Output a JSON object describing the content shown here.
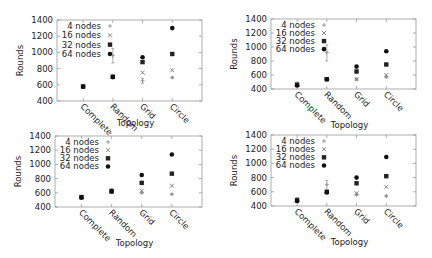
{
  "chart_data": [
    {
      "type": "scatter",
      "title": "",
      "xlabel": "Topology",
      "ylabel": "Rounds",
      "ylim": [
        400,
        1400
      ],
      "yticks": [
        400,
        600,
        800,
        1000,
        1200,
        1400
      ],
      "categories": [
        "Complete",
        "Random",
        "Grid",
        "Circle"
      ],
      "legend_position": "top-left (inside)",
      "grid": false,
      "series": [
        {
          "name": "4 nodes",
          "marker": "plus",
          "values": [
            580,
            960,
            650,
            690
          ],
          "error": [
            [
              570,
              590
            ],
            [
              870,
              1050
            ],
            [
              620,
              680
            ],
            [
              680,
              700
            ]
          ]
        },
        {
          "name": "16 nodes",
          "marker": "x",
          "values": [
            580,
            700,
            750,
            780
          ]
        },
        {
          "name": "32 nodes",
          "marker": "square",
          "values": [
            580,
            700,
            880,
            980
          ]
        },
        {
          "name": "64 nodes",
          "marker": "circle",
          "values": [
            575,
            695,
            940,
            1300
          ]
        }
      ]
    },
    {
      "type": "scatter",
      "title": "",
      "xlabel": "Topology",
      "ylabel": "Rounds",
      "ylim": [
        400,
        1400
      ],
      "yticks": [
        400,
        600,
        800,
        1000,
        1200,
        1400
      ],
      "categories": [
        "Complete",
        "Random",
        "Grid",
        "Circle"
      ],
      "legend_position": "top-left (inside)",
      "grid": false,
      "series": [
        {
          "name": "4 nodes",
          "marker": "plus",
          "values": [
            470,
            920,
            540,
            570
          ],
          "error": [
            [
              450,
              500
            ],
            [
              800,
              1030
            ],
            [
              530,
              550
            ],
            [
              560,
              580
            ]
          ]
        },
        {
          "name": "16 nodes",
          "marker": "x",
          "values": [
            470,
            540,
            540,
            600
          ]
        },
        {
          "name": "32 nodes",
          "marker": "square",
          "values": [
            460,
            540,
            650,
            750
          ]
        },
        {
          "name": "64 nodes",
          "marker": "circle",
          "values": [
            450,
            540,
            720,
            940
          ]
        }
      ]
    },
    {
      "type": "scatter",
      "title": "",
      "xlabel": "Topology",
      "ylabel": "Rounds",
      "ylim": [
        400,
        1400
      ],
      "yticks": [
        400,
        600,
        800,
        1000,
        1200,
        1400
      ],
      "categories": [
        "Complete",
        "Random",
        "Grid",
        "Circle"
      ],
      "legend_position": "top-left (inside)",
      "grid": false,
      "series": [
        {
          "name": "4 nodes",
          "marker": "plus",
          "values": [
            540,
            640,
            600,
            580
          ],
          "error": [
            [
              530,
              550
            ],
            [
              610,
              660
            ],
            [
              590,
              610
            ],
            [
              570,
              590
            ]
          ]
        },
        {
          "name": "16 nodes",
          "marker": "x",
          "values": [
            540,
            630,
            630,
            700
          ]
        },
        {
          "name": "32 nodes",
          "marker": "square",
          "values": [
            540,
            620,
            740,
            870
          ]
        },
        {
          "name": "64 nodes",
          "marker": "circle",
          "values": [
            530,
            620,
            850,
            1140
          ]
        }
      ]
    },
    {
      "type": "scatter",
      "title": "",
      "xlabel": "Topology",
      "ylabel": "Rounds",
      "ylim": [
        400,
        1400
      ],
      "yticks": [
        400,
        600,
        800,
        1000,
        1200,
        1400
      ],
      "categories": [
        "Complete",
        "Random",
        "Grid",
        "Circle"
      ],
      "legend_position": "top-left (inside)",
      "grid": false,
      "series": [
        {
          "name": "4 nodes",
          "marker": "plus",
          "values": [
            500,
            700,
            560,
            540
          ],
          "error": [
            [
              480,
              520
            ],
            [
              620,
              760
            ],
            [
              550,
              570
            ],
            [
              530,
              550
            ]
          ]
        },
        {
          "name": "16 nodes",
          "marker": "x",
          "values": [
            490,
            600,
            580,
            670
          ]
        },
        {
          "name": "32 nodes",
          "marker": "square",
          "values": [
            480,
            600,
            720,
            820
          ]
        },
        {
          "name": "64 nodes",
          "marker": "circle",
          "values": [
            470,
            590,
            800,
            1090
          ]
        }
      ]
    }
  ],
  "layout": [
    {
      "left": 57,
      "right": 202,
      "top": 20,
      "bottom": 101
    },
    {
      "left": 271,
      "right": 416,
      "top": 19,
      "bottom": 89
    },
    {
      "left": 55,
      "right": 202,
      "top": 136,
      "bottom": 207
    },
    {
      "left": 271,
      "right": 416,
      "top": 135,
      "bottom": 206
    }
  ],
  "colors": {
    "4 nodes": "#888888",
    "16 nodes": "#777777",
    "32 nodes": "#222222",
    "64 nodes": "#111111",
    "axis": "#999999",
    "text": "#222222"
  }
}
